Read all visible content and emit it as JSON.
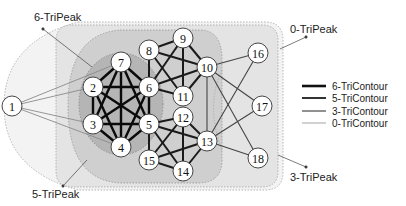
{
  "peak_labels": {
    "p6": "6-TriPeak",
    "p5": "5-TriPeak",
    "p0": "0-TriPeak",
    "p3": "3-TriPeak"
  },
  "legend": [
    {
      "label": "6-TriContour",
      "color": "#111111",
      "width": 2.6
    },
    {
      "label": "5-TriContour",
      "color": "#333333",
      "width": 2.0
    },
    {
      "label": "3-TriContour",
      "color": "#555555",
      "width": 1.3
    },
    {
      "label": "0-TriContour",
      "color": "#999999",
      "width": 0.9
    }
  ],
  "nodes": [
    {
      "id": "1",
      "x": 12,
      "y": 106
    },
    {
      "id": "2",
      "x": 93,
      "y": 87
    },
    {
      "id": "3",
      "x": 93,
      "y": 124
    },
    {
      "id": "4",
      "x": 121,
      "y": 147
    },
    {
      "id": "5",
      "x": 149,
      "y": 124
    },
    {
      "id": "6",
      "x": 149,
      "y": 87
    },
    {
      "id": "7",
      "x": 121,
      "y": 62
    },
    {
      "id": "8",
      "x": 149,
      "y": 50
    },
    {
      "id": "9",
      "x": 183,
      "y": 38
    },
    {
      "id": "10",
      "x": 207,
      "y": 67
    },
    {
      "id": "11",
      "x": 183,
      "y": 96
    },
    {
      "id": "12",
      "x": 183,
      "y": 117
    },
    {
      "id": "13",
      "x": 207,
      "y": 141
    },
    {
      "id": "14",
      "x": 183,
      "y": 171
    },
    {
      "id": "15",
      "x": 149,
      "y": 160
    },
    {
      "id": "16",
      "x": 258,
      "y": 53
    },
    {
      "id": "17",
      "x": 262,
      "y": 106
    },
    {
      "id": "18",
      "x": 258,
      "y": 158
    }
  ],
  "edges": {
    "c6": [
      [
        "2",
        "3"
      ],
      [
        "2",
        "4"
      ],
      [
        "2",
        "5"
      ],
      [
        "2",
        "6"
      ],
      [
        "2",
        "7"
      ],
      [
        "3",
        "4"
      ],
      [
        "3",
        "5"
      ],
      [
        "3",
        "6"
      ],
      [
        "3",
        "7"
      ],
      [
        "4",
        "5"
      ],
      [
        "4",
        "6"
      ],
      [
        "4",
        "7"
      ],
      [
        "5",
        "6"
      ],
      [
        "5",
        "7"
      ],
      [
        "6",
        "7"
      ]
    ],
    "c5": [
      [
        "8",
        "9"
      ],
      [
        "8",
        "10"
      ],
      [
        "8",
        "11"
      ],
      [
        "9",
        "10"
      ],
      [
        "9",
        "11"
      ],
      [
        "9",
        "6"
      ],
      [
        "10",
        "11"
      ],
      [
        "10",
        "6"
      ],
      [
        "11",
        "6"
      ],
      [
        "8",
        "6"
      ],
      [
        "12",
        "13"
      ],
      [
        "12",
        "14"
      ],
      [
        "12",
        "15"
      ],
      [
        "13",
        "14"
      ],
      [
        "13",
        "15"
      ],
      [
        "14",
        "15"
      ],
      [
        "5",
        "12"
      ],
      [
        "5",
        "13"
      ],
      [
        "5",
        "14"
      ],
      [
        "5",
        "15"
      ]
    ],
    "c3": [
      [
        "10",
        "13"
      ],
      [
        "10",
        "16"
      ],
      [
        "10",
        "17"
      ],
      [
        "10",
        "18"
      ],
      [
        "13",
        "16"
      ],
      [
        "13",
        "17"
      ],
      [
        "13",
        "18"
      ]
    ],
    "c0": [
      [
        "1",
        "2"
      ],
      [
        "1",
        "3"
      ],
      [
        "1",
        "4"
      ],
      [
        "1",
        "7"
      ]
    ]
  }
}
